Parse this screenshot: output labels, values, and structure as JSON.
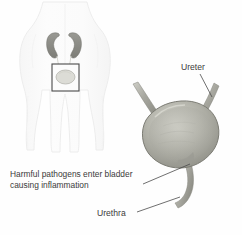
{
  "figure": {
    "title": "Harmful pathogens enter bladder causing inflammation",
    "width": 242,
    "height": 235,
    "background_color": "#fefefe"
  },
  "labels": {
    "ureter": "Ureter",
    "urethra": "Urethra",
    "pathogens_line1": "Harmful pathogens enter bladder",
    "pathogens_line2": "causing inflammation"
  },
  "colors": {
    "organ_fill": "#a9a9a2",
    "organ_fill_light": "#c3c3bb",
    "organ_outline": "#7c7c74",
    "kidney_fill": "#8e8e88",
    "body_outline": "#ededed",
    "callout_border": "#4a4a4a",
    "leader_line": "#4a4a4a",
    "text": "#3b3b3b",
    "tube_fill": "#b4b4ac"
  },
  "diagram": {
    "body_view_label": "anterior-torso-silhouette",
    "callout_box_label": "bladder-region-callout",
    "organs": [
      "left-kidney",
      "right-kidney",
      "left-ureter",
      "right-ureter",
      "bladder",
      "urethra"
    ]
  }
}
